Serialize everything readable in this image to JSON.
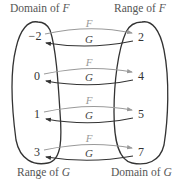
{
  "labels": {
    "domain_f": "Domain of ",
    "domain_f_var": "F",
    "range_f": "Range of ",
    "range_f_var": "F",
    "range_g": "Range of ",
    "range_g_var": "G",
    "domain_g": "Domain of ",
    "domain_g_var": "G"
  },
  "functions": {
    "f": {
      "name": "F",
      "direction": "left-to-right",
      "color": "#9a9a9a"
    },
    "g": {
      "name": "G",
      "direction": "right-to-left",
      "color": "#333333"
    }
  },
  "left_set": [
    "−2",
    "0",
    "1",
    "3"
  ],
  "right_set": [
    "2",
    "4",
    "5",
    "7"
  ],
  "mappings": [
    {
      "left": "−2",
      "right": "2",
      "f_label": "F",
      "g_label": "G"
    },
    {
      "left": "0",
      "right": "4",
      "f_label": "F",
      "g_label": "G"
    },
    {
      "left": "1",
      "right": "5",
      "f_label": "F",
      "g_label": "G"
    },
    {
      "left": "3",
      "right": "7",
      "f_label": "F",
      "g_label": "G"
    }
  ]
}
